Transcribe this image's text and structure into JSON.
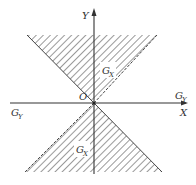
{
  "diagram": {
    "axes": {
      "x_label": "X",
      "y_label": "Y",
      "origin_label": "O"
    },
    "regions": [
      {
        "name": "upper-cone",
        "label": "G",
        "label_sub": "X"
      },
      {
        "name": "lower-cone",
        "label": "G",
        "label_sub": "X"
      }
    ],
    "axis_region_labels": [
      {
        "position": "left",
        "label": "G",
        "label_sub": "Y"
      },
      {
        "position": "right",
        "label": "G",
        "label_sub": "Y"
      }
    ],
    "colors": {
      "line": "#333333",
      "hatch": "#555555",
      "background": "#ffffff"
    }
  }
}
